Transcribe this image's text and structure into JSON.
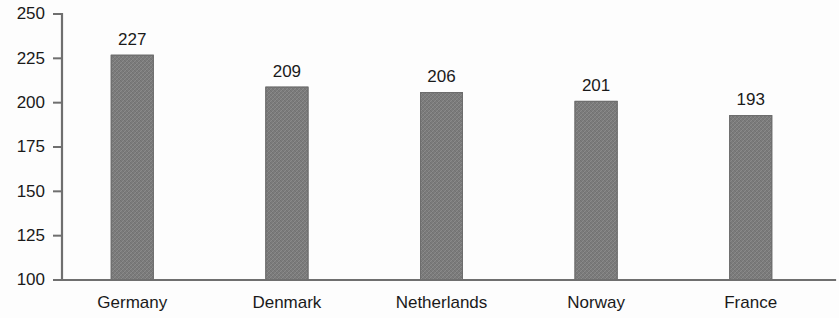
{
  "chart_data": {
    "type": "bar",
    "title": "",
    "subtitle": "",
    "xlabel": "",
    "ylabel": "",
    "categories": [
      "Germany",
      "Denmark",
      "Netherlands",
      "Norway",
      "France"
    ],
    "values": [
      227,
      209,
      206,
      201,
      193
    ],
    "value_labels": [
      "227",
      "209",
      "206",
      "201",
      "193"
    ],
    "ylim": [
      100,
      250
    ],
    "yticks": [
      100,
      125,
      150,
      175,
      200,
      225,
      250
    ],
    "ytick_labels": [
      "100",
      "125",
      "150",
      "175",
      "200",
      "225",
      "250"
    ],
    "grid": false,
    "legend": null,
    "legend_position": "none",
    "bar_color": "#7b7b7b",
    "axis_color": "#6f6f6f",
    "text_color": "#1a1a1a",
    "background_color": "#fdfdfd"
  }
}
